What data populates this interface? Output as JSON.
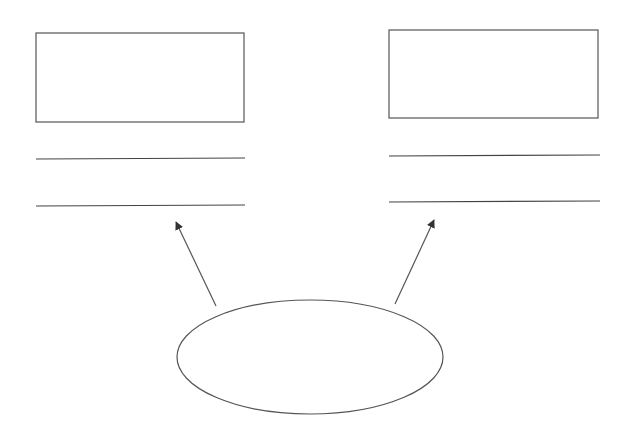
{
  "diagram": {
    "stroke_color": "#555555",
    "line_color": "#444444",
    "background": "#ffffff",
    "nodes": [
      {
        "id": "left-class",
        "kind": "class-box",
        "box": {
          "x": 36,
          "y": 33,
          "width": 208,
          "height": 89
        },
        "separators": [
          {
            "x1": 36,
            "y1": 159,
            "x2": 245,
            "y2": 158
          },
          {
            "x1": 36,
            "y1": 206,
            "x2": 245,
            "y2": 205
          }
        ],
        "label": ""
      },
      {
        "id": "right-class",
        "kind": "class-box",
        "box": {
          "x": 389,
          "y": 30,
          "width": 209,
          "height": 88
        },
        "separators": [
          {
            "x1": 389,
            "y1": 156,
            "x2": 600,
            "y2": 155
          },
          {
            "x1": 389,
            "y1": 202,
            "x2": 600,
            "y2": 201
          }
        ],
        "label": ""
      },
      {
        "id": "source-ellipse",
        "kind": "ellipse",
        "cx": 310,
        "cy": 357,
        "rx": 133,
        "ry": 57,
        "label": ""
      }
    ],
    "edges": [
      {
        "from": "source-ellipse",
        "to": "left-class",
        "x1": 216,
        "y1": 306,
        "x2": 176,
        "y2": 222,
        "arrowhead": "filled"
      },
      {
        "from": "source-ellipse",
        "to": "right-class",
        "x1": 395,
        "y1": 304,
        "x2": 434,
        "y2": 220,
        "arrowhead": "filled"
      }
    ]
  }
}
